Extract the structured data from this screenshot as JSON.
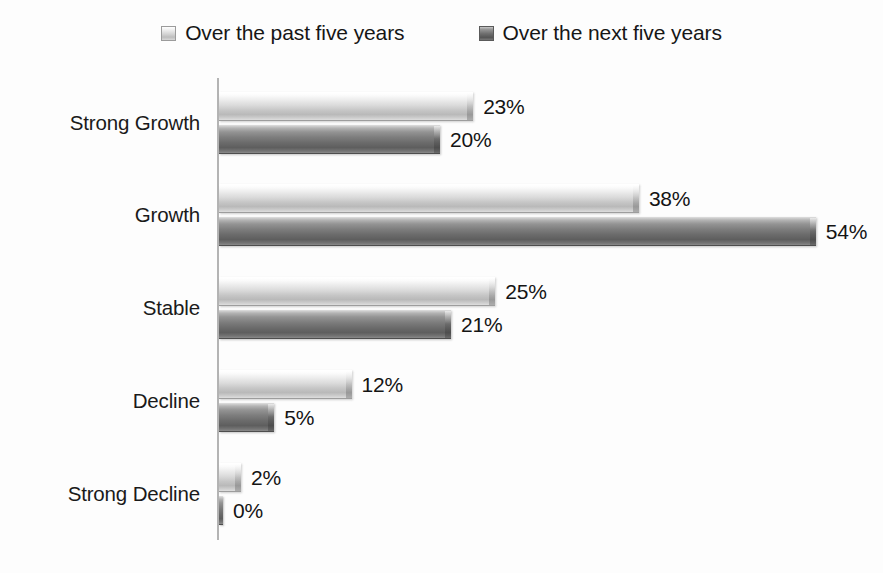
{
  "chart_data": {
    "type": "bar",
    "orientation": "horizontal",
    "grouping": "grouped",
    "title": "",
    "subtitle": "",
    "xlabel": "",
    "ylabel": "",
    "xlim": [
      0,
      60
    ],
    "grid": false,
    "legend_position": "top-center",
    "value_label_suffix": "%",
    "categories": [
      "Strong Growth",
      "Growth",
      "Stable",
      "Decline",
      "Strong Decline"
    ],
    "series": [
      {
        "name": "Over the past five years",
        "key": "past",
        "color": "#d3d3d3",
        "values": [
          23,
          38,
          25,
          12,
          2
        ],
        "value_labels": [
          "23%",
          "38%",
          "25%",
          "12%",
          "2%"
        ]
      },
      {
        "name": "Over the next five years",
        "key": "next",
        "color": "#6e6e6e",
        "values": [
          20,
          54,
          21,
          5,
          0
        ],
        "value_labels": [
          "20%",
          "54%",
          "21%",
          "5%",
          "0%"
        ]
      }
    ]
  },
  "legend": {
    "items": [
      {
        "label": "Over the past five years",
        "swatch": "past",
        "color": "#d3d3d3"
      },
      {
        "label": "Over the next five years",
        "swatch": "next",
        "color": "#6e6e6e"
      }
    ]
  },
  "rows": [
    {
      "category": "Strong Growth",
      "past": {
        "value": 23,
        "label": "23%"
      },
      "next": {
        "value": 20,
        "label": "20%"
      }
    },
    {
      "category": "Growth",
      "past": {
        "value": 38,
        "label": "38%"
      },
      "next": {
        "value": 54,
        "label": "54%"
      }
    },
    {
      "category": "Stable",
      "past": {
        "value": 25,
        "label": "25%"
      },
      "next": {
        "value": 21,
        "label": "21%"
      }
    },
    {
      "category": "Decline",
      "past": {
        "value": 12,
        "label": "12%"
      },
      "next": {
        "value": 5,
        "label": "5%"
      }
    },
    {
      "category": "Strong Decline",
      "past": {
        "value": 2,
        "label": "2%"
      },
      "next": {
        "value": 0,
        "label": "0%"
      }
    }
  ],
  "scale": {
    "px_per_percent": 11.05,
    "zero_bar_px": 4
  }
}
